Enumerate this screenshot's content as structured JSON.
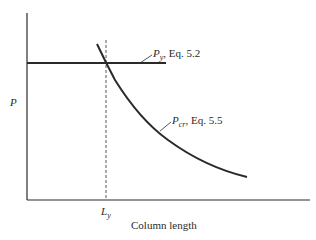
{
  "diagram": {
    "y_axis_label": "P",
    "x_axis_label": "Column length",
    "marker_label": {
      "main": "L",
      "sub": "y"
    },
    "yield_line": {
      "symbol": "P",
      "sub": "y",
      "ref": ", Eq. 5.2"
    },
    "buckling_curve": {
      "symbol": "P",
      "sub": "cr",
      "ref": ", Eq. 5.5"
    },
    "colors": {
      "line": "#2a2a2a",
      "background": "#ffffff"
    }
  }
}
